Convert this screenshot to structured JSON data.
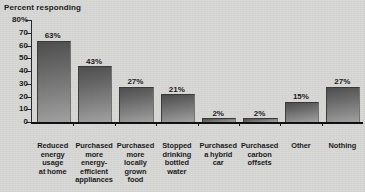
{
  "chart_data": {
    "type": "bar",
    "title": "Percent responding",
    "xlabel": "",
    "ylabel": "",
    "ylim": [
      0,
      80
    ],
    "ytick_step": 10,
    "grid": false,
    "legend": null,
    "orientation": "vertical",
    "value_labels": true,
    "categories": [
      "Reduced energy usage at home",
      "Purchased more energy-efficient appliances",
      "Purchased more locally grown food",
      "Stopped drinking bottled water",
      "Purchased a hybrid car",
      "Purchased carbon offsets",
      "Other",
      "Nothing"
    ],
    "values": [
      63,
      43,
      27,
      21,
      2,
      2,
      15,
      27
    ]
  },
  "axis": {
    "y_tick_labels": [
      "80%",
      "70",
      "60",
      "50",
      "40",
      "30",
      "20",
      "10",
      "0"
    ]
  },
  "bars": [
    {
      "value": 63,
      "value_label": "63%",
      "category_lines": [
        "Reduced",
        "energy",
        "usage",
        "at home"
      ]
    },
    {
      "value": 43,
      "value_label": "43%",
      "category_lines": [
        "Purchased",
        "more",
        "energy-",
        "efficient",
        "appliances"
      ]
    },
    {
      "value": 27,
      "value_label": "27%",
      "category_lines": [
        "Purchased",
        "more",
        "locally",
        "grown",
        "food"
      ]
    },
    {
      "value": 21,
      "value_label": "21%",
      "category_lines": [
        "Stopped",
        "drinking",
        "bottled",
        "water"
      ]
    },
    {
      "value": 2,
      "value_label": "2%",
      "category_lines": [
        "Purchased",
        "a hybrid",
        "car"
      ]
    },
    {
      "value": 2,
      "value_label": "2%",
      "category_lines": [
        "Purchased",
        "carbon",
        "offsets"
      ]
    },
    {
      "value": 15,
      "value_label": "15%",
      "category_lines": [
        "Other"
      ]
    },
    {
      "value": 27,
      "value_label": "27%",
      "category_lines": [
        "Nothing"
      ]
    }
  ],
  "colors": {
    "background": "#d8d8d6",
    "bar_dark": "#4f4f4f",
    "bar_light": "#a3a3a3",
    "axis": "#1c1c1c",
    "text": "#1c1c1c"
  }
}
